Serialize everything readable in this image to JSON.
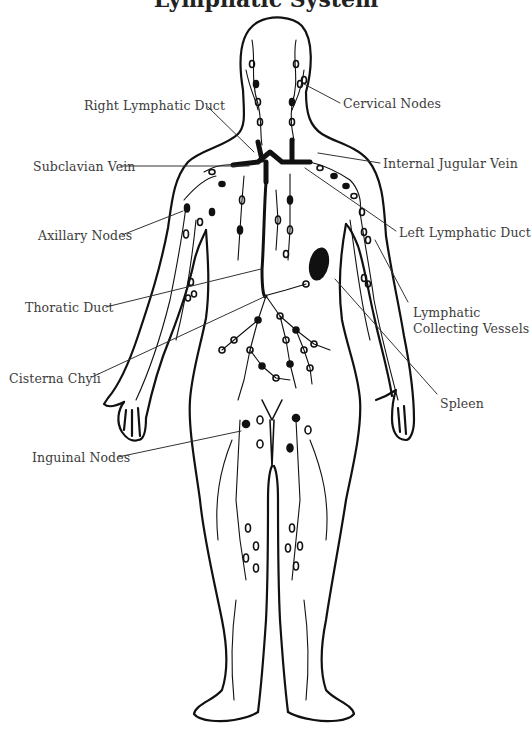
{
  "diagram": {
    "title": "Lymphatic System",
    "title_visible": "partially cropped at top edge",
    "colors": {
      "background": "#ffffff",
      "line_art": "#111111",
      "label_text": "#3c3c3c",
      "leader_line": "#333333"
    },
    "labels": [
      {
        "id": "right-lymphatic-duct",
        "text": "Right Lymphatic Duct",
        "side": "left",
        "x": 84,
        "y": 98,
        "target": [
          254,
          152
        ]
      },
      {
        "id": "cervical-nodes",
        "text": "Cervical Nodes",
        "side": "right",
        "x": 343,
        "y": 97,
        "target": [
          304,
          84
        ]
      },
      {
        "id": "subclavian-vein",
        "text": "Subclavian Vein",
        "side": "left",
        "x": 33,
        "y": 160,
        "target": [
          249,
          166
        ]
      },
      {
        "id": "internal-jugular-vein",
        "text": "Internal Jugular Vein",
        "side": "right",
        "x": 383,
        "y": 157,
        "target": [
          318,
          153
        ]
      },
      {
        "id": "axillary-nodes",
        "text": "Axillary Nodes",
        "side": "left",
        "x": 38,
        "y": 229,
        "target": [
          183,
          211
        ]
      },
      {
        "id": "left-lymphatic-duct",
        "text": "Left Lymphatic Duct",
        "side": "right",
        "x": 399,
        "y": 226,
        "target": [
          305,
          168
        ]
      },
      {
        "id": "thoratic-duct",
        "text": "Thoratic Duct",
        "side": "left",
        "x": 25,
        "y": 301,
        "target": [
          261,
          269
        ]
      },
      {
        "id": "lymphatic-collecting-vessels",
        "text": "Lymphatic\nCollecting Vessels",
        "line1": "Lymphatic",
        "line2": "Collecting Vessels",
        "side": "right",
        "x": 413,
        "y": 302,
        "target": [
          375,
          240
        ]
      },
      {
        "id": "cisterna-chyli",
        "text": "Cisterna Chyli",
        "side": "left",
        "x": 9,
        "y": 372,
        "target": [
          266,
          296
        ]
      },
      {
        "id": "spleen",
        "text": "Spleen",
        "side": "right",
        "x": 440,
        "y": 397,
        "target": [
          335,
          279
        ]
      },
      {
        "id": "inguinal-nodes",
        "text": "Inguinal Nodes",
        "side": "left",
        "x": 32,
        "y": 451,
        "target": [
          241,
          431
        ]
      }
    ]
  }
}
